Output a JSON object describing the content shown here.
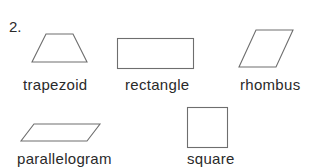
{
  "problem": {
    "number": "2."
  },
  "shapes": [
    {
      "name": "trapezoid",
      "label": "trapezoid"
    },
    {
      "name": "rectangle",
      "label": "rectangle"
    },
    {
      "name": "rhombus",
      "label": "rhombus"
    },
    {
      "name": "parallelogram",
      "label": "parallelogram"
    },
    {
      "name": "square",
      "label": "square"
    }
  ],
  "colors": {
    "text": "#2a2a2a",
    "outline": "#6e6e6e",
    "background": "#ffffff"
  }
}
